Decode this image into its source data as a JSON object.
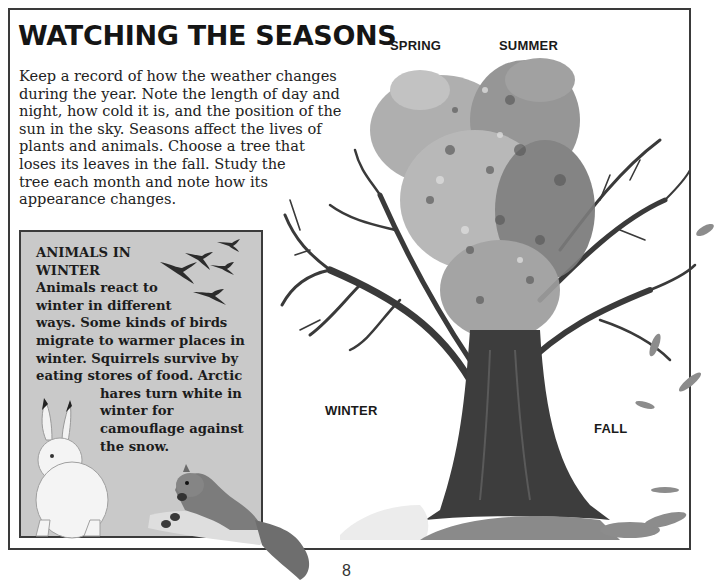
{
  "page": {
    "title": "WATCHING THE SEASONS",
    "intro_lines": [
      "Keep a record of how the weather changes",
      "during the year. Note the length of day and",
      "night, how cold it is, and the position of the",
      "sun in the sky. Seasons affect the lives of",
      "plants and animals. Choose a tree that",
      "loses its leaves in the fall. Study the",
      "tree each month and note how its",
      "appearance changes."
    ],
    "page_number": "8"
  },
  "seasons": {
    "spring": "SPRING",
    "summer": "SUMMER",
    "winter": "WINTER",
    "fall": "FALL"
  },
  "animals_box": {
    "heading_lines": [
      "ANIMALS IN",
      "WINTER"
    ],
    "body_lines": [
      "Animals react to",
      "winter in different",
      "ways. Some kinds of birds",
      "migrate to warmer places in",
      "winter. Squirrels survive by",
      "eating stores of food. Arctic"
    ],
    "indented_lines": [
      "hares turn white in",
      "winter for",
      "camouflage against",
      "the snow."
    ],
    "background_color": "#c9c9c9"
  },
  "illustrations": {
    "tree": "four-seasons-tree-illustration",
    "birds": "flying-birds-illustration",
    "hare": "arctic-hare-illustration",
    "squirrel": "squirrel-illustration"
  }
}
